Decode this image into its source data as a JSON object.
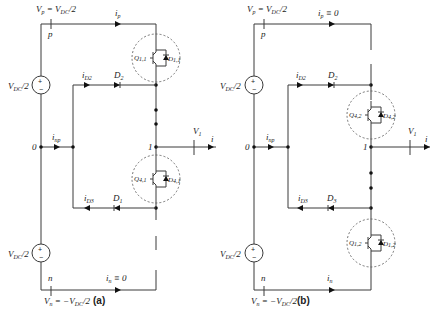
{
  "figure": {
    "panels": [
      {
        "id": "a",
        "caption": "(a)",
        "labels": {
          "vp": "V",
          "vp_sub": "p",
          "vp_rest": " = V",
          "vp_dc_sub": "DC",
          "vp_tail": "/2",
          "node_p": "p",
          "ip": "i",
          "ip_sub": "p",
          "ip_extra": "",
          "src_top": "V",
          "src_top_sub": "DC",
          "src_top_tail": "/2",
          "src_bot": "V",
          "src_bot_sub": "DC",
          "src_bot_tail": "/2",
          "node_0": "0",
          "inp": "i",
          "inp_sub": "np",
          "id2": "i",
          "id2_sub": "D2",
          "d2": "D",
          "d2_sub": "2",
          "id3": "i",
          "id3_sub": "D3",
          "d3": "D",
          "d3_sub": "1",
          "node_1": "1",
          "v1": "V",
          "v1_sub": "1",
          "i": "i",
          "node_n": "n",
          "in": "i",
          "in_sub": "n",
          "in_extra": " ≡ 0",
          "vn": "V",
          "vn_sub": "n",
          "vn_rest": " = −V",
          "vn_dc_sub": "DC",
          "vn_tail": "/2",
          "q_top": "Q",
          "q_top_sub": "1,1",
          "d_top": "D",
          "d_top_sub": "1,1",
          "q_bot": "Q",
          "q_bot_sub": "4,1",
          "d_bot": "D",
          "d_bot_sub": "4,1"
        }
      },
      {
        "id": "b",
        "caption": "(b)",
        "labels": {
          "vp": "V",
          "vp_sub": "p",
          "vp_rest": " = V",
          "vp_dc_sub": "DC",
          "vp_tail": "/2",
          "node_p": "p",
          "ip": "i",
          "ip_sub": "p",
          "ip_extra": " ≡ 0",
          "src_top": "V",
          "src_top_sub": "DC",
          "src_top_tail": "/2",
          "src_bot": "V",
          "src_bot_sub": "DC",
          "src_bot_tail": "/2",
          "node_0": "0",
          "inp": "i",
          "inp_sub": "np",
          "id2": "i",
          "id2_sub": "D2",
          "d2": "D",
          "d2_sub": "2",
          "id3": "i",
          "id3_sub": "D3",
          "d3": "D",
          "d3_sub": "3",
          "node_1": "1",
          "v1": "V",
          "v1_sub": "1",
          "i": "i",
          "node_n": "n",
          "in": "i",
          "in_sub": "n",
          "in_extra": "",
          "vn": "V",
          "vn_sub": "n",
          "vn_rest": " = −V",
          "vn_dc_sub": "DC",
          "vn_tail": "/2",
          "q_top": "Q",
          "q_top_sub": "4,2",
          "d_top": "D",
          "d_top_sub": "4,2",
          "q_bot": "Q",
          "q_bot_sub": "1,2",
          "d_bot": "D",
          "d_bot_sub": "1,2"
        }
      }
    ]
  }
}
